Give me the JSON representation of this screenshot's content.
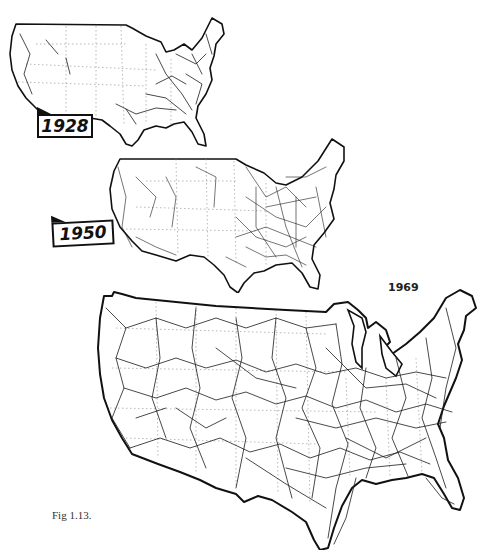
{
  "figure": {
    "caption": "Fig 1.13.",
    "background_color": "#ffffff",
    "line_color": "#111111"
  },
  "maps": [
    {
      "id": "1928",
      "label": "1928",
      "label_style": "boxed-flag",
      "network_density": "sparse, concentrated in east and west coast"
    },
    {
      "id": "1950",
      "label": "1950",
      "label_style": "boxed-flag",
      "network_density": "dense in east, moderate in west"
    },
    {
      "id": "1969",
      "label": "1969",
      "label_style": "plain-text",
      "network_density": "interconnected nationwide grid"
    }
  ]
}
